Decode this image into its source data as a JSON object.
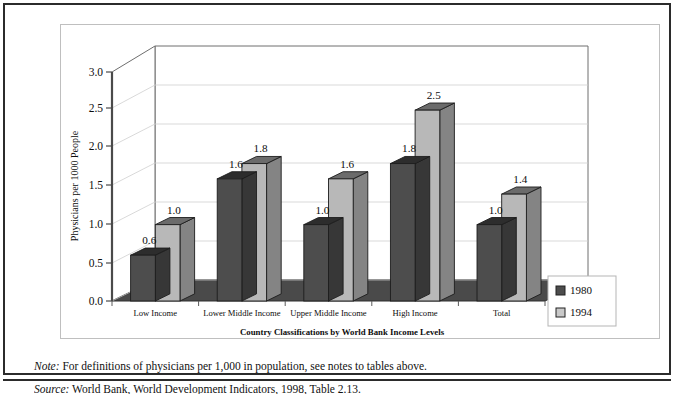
{
  "figure": {
    "note_label": "Note:",
    "note_text": " For definitions of physicians per 1,000 in population, see notes to tables above.",
    "source_label": "Source:",
    "source_text": " World Bank, World Development Indicators, 1998, Table 2.13."
  },
  "legend": {
    "items": [
      {
        "label": "1980",
        "swatch": "#4d4d4d"
      },
      {
        "label": "1994",
        "swatch": "#b8b8b8"
      }
    ]
  },
  "axis": {
    "y_title": "Physicians per 1000 People",
    "x_title": "Country Classifications by World Bank Income Levels",
    "y_ticks": [
      "0.0",
      "0.5",
      "1.0",
      "1.5",
      "2.0",
      "2.5",
      "3.0"
    ]
  },
  "chart_data": {
    "type": "bar",
    "title": "",
    "subtitle": "",
    "xlabel": "Country Classifications by World Bank Income Levels",
    "ylabel": "Physicians per 1000 People",
    "ylim": [
      0.0,
      3.0
    ],
    "ytick_step": 0.5,
    "grid": true,
    "legend_position": "right",
    "three_d": true,
    "categories": [
      "Low Income",
      "Lower Middle Income",
      "Upper Middle Income",
      "High Income",
      "Total"
    ],
    "series": [
      {
        "name": "1980",
        "color": "#4d4d4d",
        "values": [
          0.6,
          1.6,
          1.0,
          1.8,
          1.0
        ],
        "labels": [
          "0.6",
          "1.6",
          "1.0",
          "1.8",
          "1.0"
        ]
      },
      {
        "name": "1994",
        "color": "#b8b8b8",
        "values": [
          1.0,
          1.8,
          1.6,
          2.5,
          1.4
        ],
        "labels": [
          "1.0",
          "1.8",
          "1.6",
          "2.5",
          "1.4"
        ]
      }
    ]
  }
}
